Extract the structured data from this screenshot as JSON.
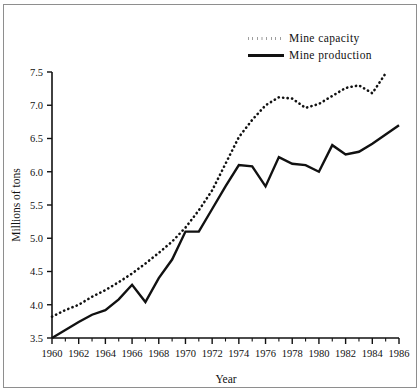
{
  "chart_data": {
    "type": "line",
    "title": "",
    "xlabel": "Year",
    "ylabel": "Millions of tons",
    "xlim": [
      1960,
      1986
    ],
    "ylim": [
      3.5,
      7.5
    ],
    "grid": false,
    "legend_position": "top-right",
    "x": [
      1960,
      1961,
      1962,
      1963,
      1964,
      1965,
      1966,
      1967,
      1968,
      1969,
      1970,
      1971,
      1972,
      1973,
      1974,
      1975,
      1976,
      1977,
      1978,
      1979,
      1980,
      1981,
      1982,
      1983,
      1984,
      1985,
      1986
    ],
    "series": [
      {
        "name": "Mine capacity",
        "style": "dotted",
        "values": [
          3.82,
          3.92,
          4.0,
          4.12,
          4.22,
          4.34,
          4.47,
          4.62,
          4.78,
          4.95,
          5.16,
          5.42,
          5.72,
          6.12,
          6.52,
          6.78,
          7.0,
          7.12,
          7.1,
          6.96,
          7.02,
          7.14,
          7.26,
          7.3,
          7.18,
          7.48,
          null
        ]
      },
      {
        "name": "Mine production",
        "style": "solid",
        "values": [
          3.5,
          3.62,
          3.74,
          3.85,
          3.92,
          4.08,
          4.3,
          4.04,
          4.4,
          4.68,
          5.1,
          5.1,
          5.44,
          5.78,
          6.1,
          6.08,
          5.78,
          6.22,
          6.12,
          6.1,
          6.0,
          6.4,
          6.26,
          6.3,
          6.42,
          6.56,
          6.7
        ]
      }
    ],
    "x_ticks_major": [
      1960,
      1962,
      1964,
      1966,
      1968,
      1970,
      1972,
      1974,
      1976,
      1978,
      1980,
      1982,
      1984,
      1986
    ],
    "x_ticks_minor": [
      1961,
      1963,
      1965,
      1967,
      1969,
      1971,
      1973,
      1975,
      1977,
      1979,
      1981,
      1983,
      1985
    ],
    "y_ticks": [
      3.5,
      4.0,
      4.5,
      5.0,
      5.5,
      6.0,
      6.5,
      7.0,
      7.5
    ],
    "y_tick_labels": [
      "3.5",
      "4.0",
      "4.5",
      "5.0",
      "5.5",
      "6.0",
      "6.5",
      "7.0",
      "7.5"
    ],
    "x_tick_labels": [
      "1960",
      "1962",
      "1964",
      "1966",
      "1968",
      "1970",
      "1972",
      "1974",
      "1976",
      "1978",
      "1980",
      "1982",
      "1984",
      "1986"
    ]
  },
  "legend": {
    "items": [
      {
        "label": "Mine  capacity",
        "style": "dotted"
      },
      {
        "label": "Mine  production",
        "style": "solid"
      }
    ]
  },
  "colors": {
    "ink": "#111111",
    "frame": "#8e8e8e",
    "background": "#ffffff"
  }
}
